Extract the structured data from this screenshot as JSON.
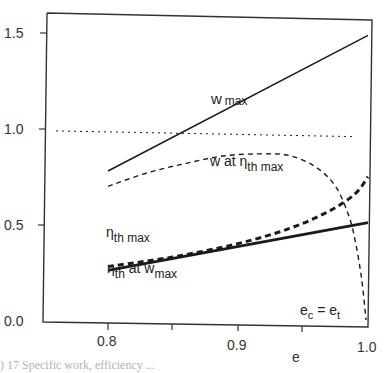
{
  "chart_data": {
    "type": "line",
    "title": "",
    "xlabel": "e",
    "ylabel": "",
    "xlim": [
      0.75,
      1.0
    ],
    "ylim": [
      0.0,
      1.6
    ],
    "x_ticks": [
      0.8,
      0.85,
      0.9,
      0.95,
      1.0
    ],
    "x_tick_labels": [
      "0.8",
      "",
      "0.9",
      "",
      "1.0"
    ],
    "y_ticks": [
      0.0,
      0.5,
      1.0,
      1.5
    ],
    "y_tick_labels": [
      "0.0",
      "0.5",
      "1.0",
      "1.5"
    ],
    "grid": false,
    "legend": "none (inline annotations)",
    "series": [
      {
        "name": "w max",
        "style": "solid-thin",
        "x": [
          0.8,
          1.0
        ],
        "y": [
          0.78,
          1.49
        ]
      },
      {
        "name": "w at η th max",
        "style": "dashed-thin",
        "x": [
          0.8,
          0.83,
          0.86,
          0.89,
          0.92,
          0.94,
          0.96,
          0.975,
          0.985,
          0.99,
          0.995,
          0.9985
        ],
        "y": [
          0.7,
          0.77,
          0.82,
          0.86,
          0.87,
          0.86,
          0.8,
          0.7,
          0.55,
          0.42,
          0.22,
          0.0
        ]
      },
      {
        "name": "η th max",
        "style": "dashed-thick",
        "x": [
          0.8,
          0.85,
          0.9,
          0.94,
          0.97,
          0.99,
          1.0
        ],
        "y": [
          0.28,
          0.33,
          0.4,
          0.48,
          0.57,
          0.66,
          0.75
        ]
      },
      {
        "name": "η th at w max",
        "style": "solid-thick",
        "x": [
          0.8,
          1.0
        ],
        "y": [
          0.26,
          0.51
        ]
      },
      {
        "name": "reference (dotted)",
        "style": "dotted",
        "x": [
          0.76,
          0.99
        ],
        "y": [
          0.99,
          0.96
        ]
      }
    ],
    "annotations": [
      {
        "text": "w max",
        "x": 0.86,
        "y": 1.08
      },
      {
        "text": "w at η th max",
        "x": 0.905,
        "y": 0.82
      },
      {
        "text": "η th max",
        "x": 0.825,
        "y": 0.44
      },
      {
        "text": "η th at w max",
        "x": 0.83,
        "y": 0.18
      },
      {
        "text": "e c = e t",
        "x": 0.975,
        "y": 0.08
      }
    ]
  },
  "labels": {
    "xlabel": "e",
    "y_tick_0": "0.0",
    "y_tick_1": "0.5",
    "y_tick_2": "1.0",
    "y_tick_3": "1.5",
    "x_tick_0": "0.8",
    "x_tick_1": "0.9",
    "x_tick_2": "1.0",
    "w_max_main": "w",
    "w_max_sub": "max",
    "w_at_main": "w at η",
    "w_at_sub": "th max",
    "eta_max_main": "η",
    "eta_max_sub": "th max",
    "eta_at_main": "η",
    "eta_at_sub": "th",
    "eta_at_mid": " at  w",
    "eta_at_sub2": "max",
    "ec_main": "e",
    "ec_sub": "c",
    "ec_eq": " =  e",
    "ec_sub2": "t",
    "caption": ") 17  Specific work, efficiency ..."
  }
}
